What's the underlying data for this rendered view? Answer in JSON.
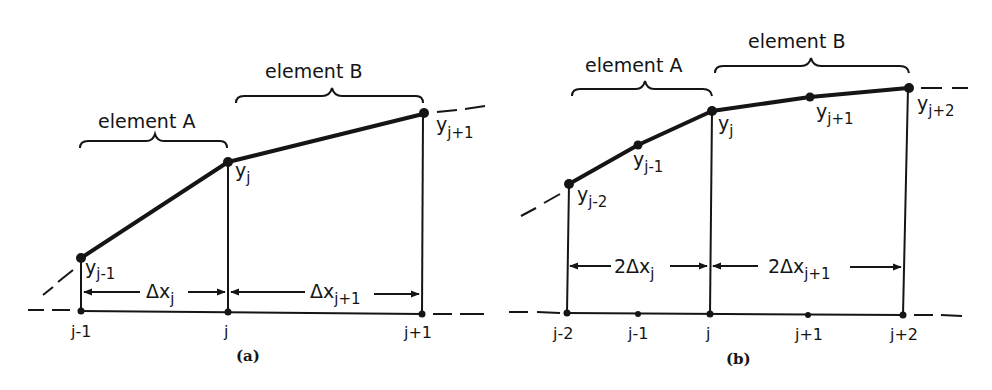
{
  "figure": {
    "ink_color": "#151515",
    "background": "#ffffff",
    "panels": [
      {
        "id": "a",
        "caption": "(a)",
        "element_labels": {
          "A": "element A",
          "B": "element B"
        },
        "nodes": [
          {
            "label": "j-1",
            "x": 81,
            "base_y": 312
          },
          {
            "label": "j",
            "x": 228,
            "base_y": 312
          },
          {
            "label": "j+1",
            "x": 422,
            "base_y": 312
          }
        ],
        "curve_points": [
          {
            "var": "y",
            "sub": "j-1",
            "x": 81,
            "y": 258
          },
          {
            "var": "y",
            "sub": "j",
            "x": 228,
            "y": 162
          },
          {
            "var": "y",
            "sub": "j+1",
            "x": 423,
            "y": 114
          }
        ],
        "spacing_labels": [
          {
            "text": "Δx",
            "sub": "j"
          },
          {
            "text": "Δx",
            "sub": "j+1"
          }
        ]
      },
      {
        "id": "b",
        "caption": "(b)",
        "element_labels": {
          "A": "element A",
          "B": "element B"
        },
        "nodes": [
          {
            "label": "j-2",
            "x": 567,
            "base_y": 313
          },
          {
            "label": "j-1",
            "x": 638,
            "base_y": 314
          },
          {
            "label": "j",
            "x": 710,
            "base_y": 314
          },
          {
            "label": "j+1",
            "x": 808,
            "base_y": 315
          },
          {
            "label": "j+2",
            "x": 903,
            "base_y": 315
          }
        ],
        "curve_points": [
          {
            "var": "y",
            "sub": "j-2",
            "x": 569,
            "y": 184
          },
          {
            "var": "y",
            "sub": "j-1",
            "x": 638,
            "y": 145
          },
          {
            "var": "y",
            "sub": "j",
            "x": 712,
            "y": 111
          },
          {
            "var": "y",
            "sub": "j+1",
            "x": 810,
            "y": 97
          },
          {
            "var": "y",
            "sub": "j+2",
            "x": 908,
            "y": 88
          }
        ],
        "spacing_labels": [
          {
            "text": "2Δx",
            "sub": "j"
          },
          {
            "text": "2Δx",
            "sub": "j+1"
          }
        ]
      }
    ]
  }
}
